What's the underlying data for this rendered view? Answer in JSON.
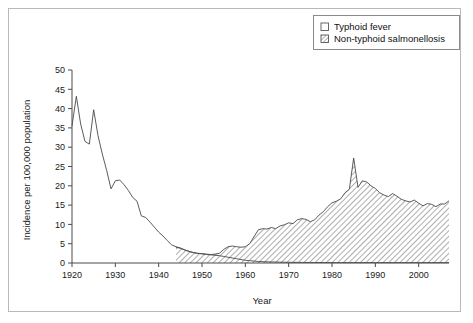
{
  "figure": {
    "border_color": "#b9b9b9",
    "background": "#ffffff"
  },
  "legend": {
    "position": "top-right",
    "entries": [
      {
        "label": "Typhoid fever",
        "marker": "empty-square",
        "swatch_name": "legend-swatch-typhoid"
      },
      {
        "label": "Non-typhoid salmonellosis",
        "marker": "hatched-square",
        "swatch_name": "legend-swatch-salmonellosis"
      }
    ]
  },
  "chart_data": {
    "type": "area",
    "title": "",
    "xlabel": "Year",
    "ylabel": "Incidence per 100,000 population",
    "xlim": [
      1920,
      2007
    ],
    "ylim": [
      0,
      50
    ],
    "xticks": [
      1920,
      1930,
      1940,
      1950,
      1960,
      1970,
      1980,
      1990,
      2000
    ],
    "yticks": [
      0,
      5,
      10,
      15,
      20,
      25,
      30,
      35,
      40,
      45,
      50
    ],
    "grid": false,
    "legend_position": "top-right",
    "x": [
      1920,
      1921,
      1922,
      1923,
      1924,
      1925,
      1926,
      1927,
      1928,
      1929,
      1930,
      1931,
      1932,
      1933,
      1934,
      1935,
      1936,
      1937,
      1938,
      1939,
      1940,
      1941,
      1942,
      1943,
      1944,
      1945,
      1946,
      1947,
      1948,
      1949,
      1950,
      1951,
      1952,
      1953,
      1954,
      1955,
      1956,
      1957,
      1958,
      1959,
      1960,
      1961,
      1962,
      1963,
      1964,
      1965,
      1966,
      1967,
      1968,
      1969,
      1970,
      1971,
      1972,
      1973,
      1974,
      1975,
      1976,
      1977,
      1978,
      1979,
      1980,
      1981,
      1982,
      1983,
      1984,
      1985,
      1986,
      1987,
      1988,
      1989,
      1990,
      1991,
      1992,
      1993,
      1994,
      1995,
      1996,
      1997,
      1998,
      1999,
      2000,
      2001,
      2002,
      2003,
      2004,
      2005,
      2006,
      2007
    ],
    "series": [
      {
        "name": "Typhoid fever",
        "fill": "none",
        "values": [
          35.5,
          43.2,
          36.0,
          31.5,
          30.8,
          39.7,
          33.0,
          28.2,
          24.0,
          19.2,
          21.3,
          21.5,
          20.3,
          18.8,
          17.0,
          16.0,
          12.2,
          11.8,
          10.6,
          9.3,
          8.0,
          7.0,
          5.8,
          4.7,
          4.2,
          3.9,
          3.4,
          3.0,
          2.7,
          2.5,
          2.4,
          2.2,
          2.1,
          2.0,
          1.9,
          1.7,
          1.5,
          1.3,
          1.1,
          0.9,
          0.7,
          0.6,
          0.5,
          0.4,
          0.35,
          0.3,
          0.28,
          0.25,
          0.22,
          0.2,
          0.18,
          0.17,
          0.16,
          0.15,
          0.14,
          0.13,
          0.12,
          0.12,
          0.11,
          0.11,
          0.1,
          0.1,
          0.1,
          0.1,
          0.1,
          0.1,
          0.1,
          0.1,
          0.1,
          0.1,
          0.1,
          0.1,
          0.1,
          0.1,
          0.1,
          0.1,
          0.1,
          0.1,
          0.1,
          0.1,
          0.1,
          0.1,
          0.1,
          0.1,
          0.1,
          0.1,
          0.1,
          0.1
        ]
      },
      {
        "name": "Non-typhoid salmonellosis",
        "fill": "diagonal-hatch",
        "values": [
          0,
          0,
          0,
          0,
          0,
          0,
          0,
          0,
          0,
          0,
          0,
          0,
          0,
          0,
          0,
          0,
          0,
          0,
          0,
          0,
          0,
          0,
          0,
          0,
          4.1,
          3.8,
          3.4,
          3.0,
          2.7,
          2.5,
          2.4,
          2.3,
          2.2,
          2.3,
          2.5,
          3.5,
          4.2,
          4.4,
          4.2,
          4.1,
          4.2,
          5.0,
          6.8,
          8.6,
          8.9,
          8.8,
          9.2,
          8.9,
          9.6,
          9.9,
          10.4,
          10.2,
          11.2,
          11.5,
          11.3,
          10.7,
          11.2,
          12.4,
          13.3,
          14.6,
          15.6,
          16.0,
          16.6,
          18.2,
          19.1,
          27.2,
          19.6,
          21.3,
          21.0,
          20.0,
          19.3,
          18.2,
          17.6,
          17.2,
          18.0,
          17.3,
          16.5,
          16.1,
          15.8,
          16.3,
          15.5,
          14.8,
          15.4,
          15.2,
          14.6,
          15.3,
          15.3,
          16.1
        ]
      }
    ]
  }
}
